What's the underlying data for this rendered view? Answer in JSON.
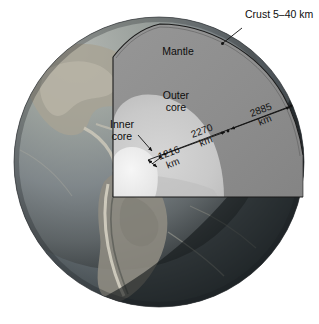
{
  "figure": {
    "background_color": "#ffffff"
  },
  "labels": {
    "crust": "Crust 5–40 km",
    "mantle": "Mantle",
    "outer_core_line1": "Outer",
    "outer_core_line2": "core",
    "inner_core_line1": "Inner",
    "inner_core_line2": "core"
  },
  "dimensions": [
    {
      "id": "inner-core-radius",
      "value": "1216",
      "unit": "km",
      "label": "1216 km"
    },
    {
      "id": "outer-core-thickness",
      "value": "2270",
      "unit": "km",
      "label": "2270 km"
    },
    {
      "id": "mantle-thickness",
      "value": "2885",
      "unit": "km",
      "label": "2885 km"
    }
  ],
  "dimension_values": {
    "inner_core_number": "1216",
    "inner_core_unit": "km",
    "outer_core_number": "2270",
    "outer_core_unit": "km",
    "mantle_number": "2885",
    "mantle_unit": "km"
  },
  "layers": [
    {
      "name": "crust",
      "display": "Crust 5–40 km",
      "color": "#6f6f6f"
    },
    {
      "name": "mantle",
      "display": "Mantle",
      "color": "#8e8e8e"
    },
    {
      "name": "outer-core",
      "display": "Outer core",
      "color": "#c9c9c9"
    },
    {
      "name": "inner-core",
      "display": "Inner core",
      "color": "#ececec"
    }
  ],
  "colors": {
    "globe_lit": "#8b8d8a",
    "globe_shadow": "#2a2c2b",
    "ocean": "#7e8a90",
    "land": "#9a958c",
    "mantle_face": "#8e8e8e",
    "mantle_face_shaded": "#7c7c7c",
    "outer_core_face": "#c9c9c9",
    "inner_core_face": "#efefef",
    "outline": "#1a1a1a",
    "text": "#0d0d0d",
    "background": "#ffffff"
  }
}
